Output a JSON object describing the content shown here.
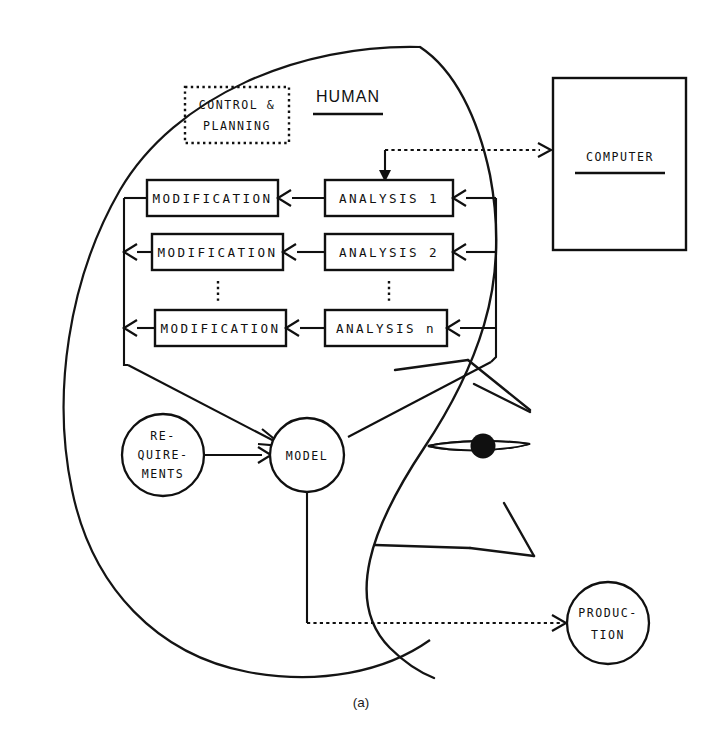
{
  "figure": {
    "caption": "(a)",
    "human_label": "HUMAN",
    "computer_label": "COMPUTER",
    "control_planning": {
      "line1": "CONTROL &",
      "line2": "PLANNING"
    },
    "requirements": {
      "line1": "RE-",
      "line2": "QUIRE-",
      "line3": "MENTS"
    },
    "model_label": "MODEL",
    "production": {
      "line1": "PRODUC-",
      "line2": "TION"
    },
    "rows": [
      {
        "modification": "MODIFICATION",
        "analysis": "ANALYSIS   1"
      },
      {
        "modification": "MODIFICATION",
        "analysis": "ANALYSIS   2"
      },
      {
        "modification": "MODIFICATION",
        "analysis": "ANALYSIS   n"
      }
    ],
    "colors": {
      "ink": "#101010",
      "paper": "#ffffff"
    }
  }
}
